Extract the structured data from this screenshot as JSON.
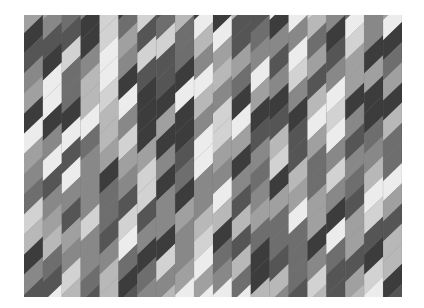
{
  "artwork": {
    "description": "Abstract grayscale painting of vertical columns filled with diagonal parallelogram bands",
    "columns": 20,
    "rows": 14,
    "palette": [
      "#3c3c3c",
      "#555555",
      "#6e6e6e",
      "#888888",
      "#a0a0a0",
      "#b8b8b8",
      "#d2d2d2",
      "#ececec"
    ],
    "seed": 7
  }
}
